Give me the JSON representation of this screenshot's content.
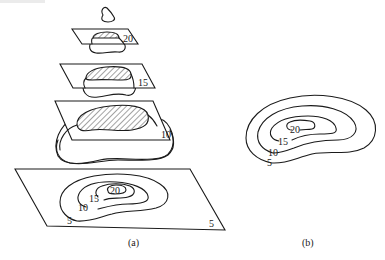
{
  "figure": {
    "panel_a": {
      "caption": "(a)",
      "slices": [
        {
          "level": "20",
          "label": "20"
        },
        {
          "level": "15",
          "label": "15"
        },
        {
          "level": "10",
          "label": "10"
        }
      ],
      "base_plane": {
        "contour_labels": [
          "20",
          "15",
          "10",
          "5"
        ],
        "corner_label": "5"
      }
    },
    "panel_b": {
      "caption": "(b)",
      "contour_labels": [
        "20",
        "15",
        "10",
        "5"
      ]
    }
  }
}
